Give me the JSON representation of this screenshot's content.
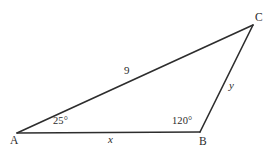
{
  "figure": {
    "type": "triangle-diagram",
    "background_color": "#ffffff",
    "stroke_color": "#2d2d2d",
    "text_color": "#2b2b2b",
    "width": 279,
    "height": 150,
    "vertices": [
      {
        "id": "A",
        "label": "A",
        "x": 17,
        "y": 133
      },
      {
        "id": "B",
        "label": "B",
        "x": 200,
        "y": 132
      },
      {
        "id": "C",
        "label": "C",
        "x": 253,
        "y": 25
      }
    ],
    "sides": [
      {
        "id": "AC",
        "label": "9",
        "from": "A",
        "to": "C",
        "italic": false
      },
      {
        "id": "BC",
        "label": "y",
        "from": "B",
        "to": "C",
        "italic": true
      },
      {
        "id": "AB",
        "label": "x",
        "from": "A",
        "to": "B",
        "italic": true
      }
    ],
    "angles": [
      {
        "at": "A",
        "label": "25°",
        "value": 25,
        "unit": "degrees"
      },
      {
        "at": "B",
        "label": "120°",
        "value": 120,
        "unit": "degrees"
      }
    ]
  }
}
